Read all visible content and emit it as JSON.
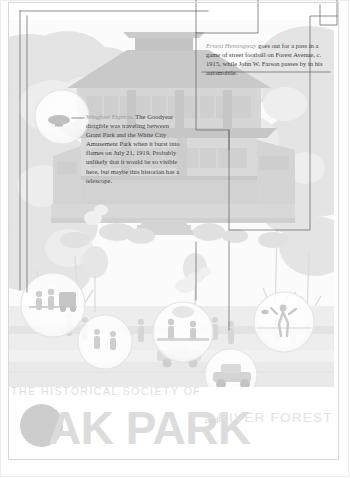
{
  "page": {
    "background_color": "#ffffff",
    "frame_color": "#d8d8d8"
  },
  "captions": [
    {
      "id": "hemingway",
      "lede": "Ernest Hemingway",
      "body": " goes out for a pass in a game of street football on Forest Avenue, c. 1915, while John W. Farson passes by in his automobile.",
      "lede_color": "#9a9a9a",
      "body_color": "#3d3d3d"
    },
    {
      "id": "wingfoot",
      "lede": "Wingfoot Express.",
      "body": " The Goodyear dirigible was traveling between Grant Park and the White City Amusement Park when it burst into flames on July 21, 1919. Probably unlikely that it would be so visible here, but maybe this historian has a telescope.",
      "lede_color": "#9a9a9a",
      "body_color": "#3d3d3d"
    }
  ],
  "logo": {
    "line1": "THE HISTORICAL SOCIETY OF",
    "main": "AK PARK",
    "amp": "and",
    "line3": "RIVER FOREST",
    "dot_color": "#cdcdcd",
    "main_color": "#dcdcdc",
    "line1_color": "#dedede",
    "line3_color": "#e3e3e3"
  },
  "illustration": {
    "subject": "prairie-style-house-streetscape",
    "description": "Faded pale grayscale illustration of a Prairie School house with trees, sky, lawn, sidewalk and small figures",
    "sky_color": "#f4f4f4",
    "tree_color": "#e2e2e2",
    "house_color": "#d5d5d5",
    "roof_color": "#c9c9c9",
    "lawn_color": "#e8e8e8",
    "magnifiers": [
      {
        "name": "dirigible-magnifier",
        "cx": 62,
        "cy": 117,
        "r": 27
      },
      {
        "name": "balcony-magnifier",
        "cx": 53,
        "cy": 305,
        "r": 32
      },
      {
        "name": "porch-magnifier",
        "cx": 105,
        "cy": 340,
        "r": 27
      },
      {
        "name": "street-magnifier",
        "cx": 182,
        "cy": 335,
        "r": 30
      },
      {
        "name": "automobile-magnifier",
        "cx": 231,
        "cy": 375,
        "r": 26
      },
      {
        "name": "football-magnifier",
        "cx": 284,
        "cy": 322,
        "r": 30
      }
    ]
  }
}
